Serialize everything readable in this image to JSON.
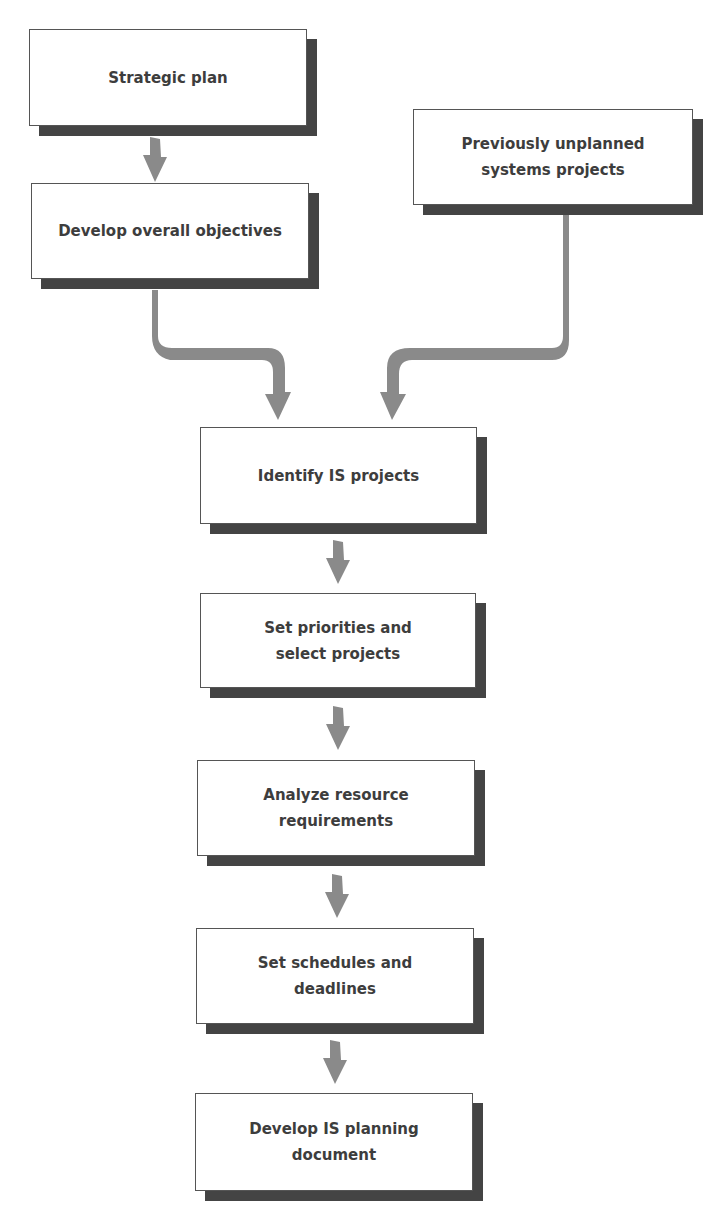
{
  "diagram": {
    "type": "flowchart",
    "colors": {
      "box_border": "#555555",
      "box_shadow": "#444444",
      "arrow": "#8a8a8a",
      "text": "#3d3d3d"
    },
    "nodes": [
      {
        "id": "strategic-plan",
        "label": "Strategic plan"
      },
      {
        "id": "develop-objectives",
        "label": "Develop overall objectives"
      },
      {
        "id": "unplanned-projects",
        "label": "Previously unplanned systems projects"
      },
      {
        "id": "identify-projects",
        "label": "Identify IS projects"
      },
      {
        "id": "set-priorities",
        "label": "Set priorities and select projects"
      },
      {
        "id": "analyze-resources",
        "label": "Analyze resource requirements"
      },
      {
        "id": "set-schedules",
        "label": "Set schedules and deadlines"
      },
      {
        "id": "planning-document",
        "label": "Develop IS planning document"
      }
    ],
    "edges": [
      {
        "from": "strategic-plan",
        "to": "develop-objectives"
      },
      {
        "from": "develop-objectives",
        "to": "identify-projects"
      },
      {
        "from": "unplanned-projects",
        "to": "identify-projects"
      },
      {
        "from": "identify-projects",
        "to": "set-priorities"
      },
      {
        "from": "set-priorities",
        "to": "analyze-resources"
      },
      {
        "from": "analyze-resources",
        "to": "set-schedules"
      },
      {
        "from": "set-schedules",
        "to": "planning-document"
      }
    ]
  }
}
